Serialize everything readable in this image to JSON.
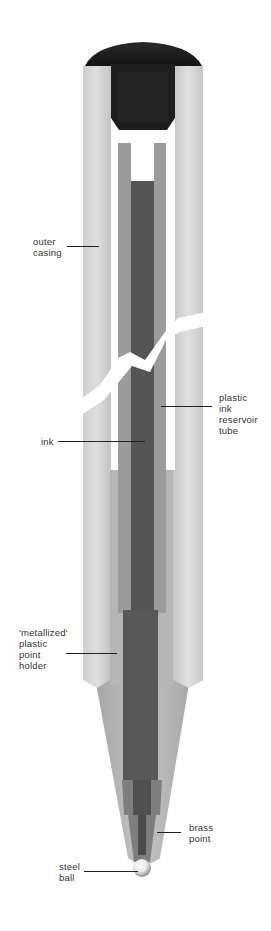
{
  "diagram": {
    "colors": {
      "cap": "#1c1c1c",
      "casing": "#c9c9c9",
      "casing_highlight": "#e4e4e4",
      "reservoir_tube": "#9b9b9b",
      "point_holder": "#b4b4b4",
      "ink": "#555555",
      "brass_point": "#8a8a8a",
      "ball": "#f0f0f0",
      "background": "#ffffff",
      "label_text": "#333333"
    },
    "labels": [
      {
        "id": "outer-casing",
        "text": "outer\ncasing",
        "x": 33,
        "y": 236,
        "line_x1": 67,
        "line_x2": 99,
        "line_y": 247
      },
      {
        "id": "plastic-ink-reservoir-tube",
        "text": "plastic\nink\nreservoir\ntube",
        "x": 219,
        "y": 392,
        "line_x1": 161,
        "line_x2": 212,
        "line_y": 407
      },
      {
        "id": "ink",
        "text": "ink",
        "x": 41,
        "y": 437,
        "line_x1": 58,
        "line_x2": 145,
        "line_y": 442
      },
      {
        "id": "metallized-plastic-point-holder",
        "text": "'metallized'\nplastic\npoint\nholder",
        "x": 19,
        "y": 627,
        "line_x1": 66,
        "line_x2": 117,
        "line_y": 654
      },
      {
        "id": "brass-point",
        "text": "brass\npoint",
        "x": 189,
        "y": 822,
        "line_x1": 157,
        "line_x2": 181,
        "line_y": 833
      },
      {
        "id": "steel-ball",
        "text": "steel\nball",
        "x": 59,
        "y": 861,
        "line_x1": 84,
        "line_x2": 138,
        "line_y": 872
      }
    ]
  }
}
